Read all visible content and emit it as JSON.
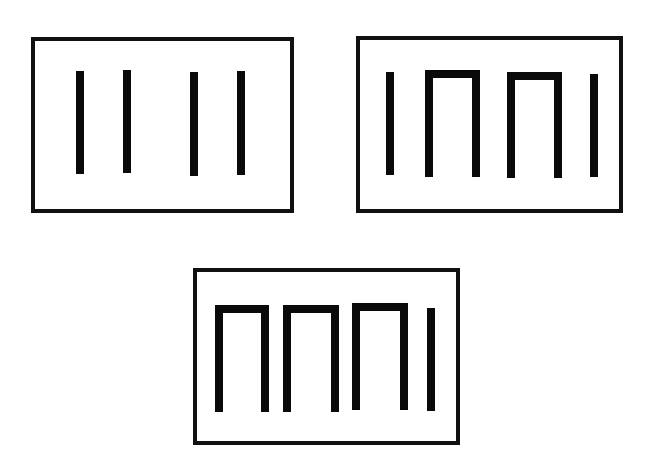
{
  "figure": {
    "colors": {
      "background": "#ffffff",
      "ink": "#0a0a0a",
      "frame": "#111111"
    },
    "panels": [
      {
        "id": "panel-1",
        "position": "top-left",
        "frame": {
          "x": 33,
          "y": 39,
          "w": 259,
          "h": 172
        },
        "elements": [
          {
            "type": "bar",
            "x": 80,
            "y1": 71,
            "y2": 174
          },
          {
            "type": "bar",
            "x": 127,
            "y1": 70,
            "y2": 173
          },
          {
            "type": "bar",
            "x": 194,
            "y1": 72,
            "y2": 176
          },
          {
            "type": "bar",
            "x": 241,
            "y1": 71,
            "y2": 175
          }
        ]
      },
      {
        "id": "panel-2",
        "position": "top-right",
        "frame": {
          "x": 358,
          "y": 38,
          "w": 263,
          "h": 173
        },
        "elements": [
          {
            "type": "bar",
            "x": 390,
            "y1": 72,
            "y2": 175
          },
          {
            "type": "arch",
            "x1": 429,
            "x2": 476,
            "top": 74,
            "bottom": 177
          },
          {
            "type": "arch",
            "x1": 511,
            "x2": 558,
            "top": 76,
            "bottom": 178
          },
          {
            "type": "bar",
            "x": 594,
            "y1": 74,
            "y2": 177
          }
        ]
      },
      {
        "id": "panel-3",
        "position": "bottom-center",
        "frame": {
          "x": 195,
          "y": 270,
          "w": 263,
          "h": 173
        },
        "elements": [
          {
            "type": "arch",
            "x1": 219,
            "x2": 265,
            "top": 309,
            "bottom": 412
          },
          {
            "type": "arch",
            "x1": 287,
            "x2": 335,
            "top": 309,
            "bottom": 412
          },
          {
            "type": "arch",
            "x1": 356,
            "x2": 404,
            "top": 307,
            "bottom": 410
          },
          {
            "type": "bar",
            "x": 431,
            "y1": 308,
            "y2": 411
          }
        ]
      }
    ]
  }
}
